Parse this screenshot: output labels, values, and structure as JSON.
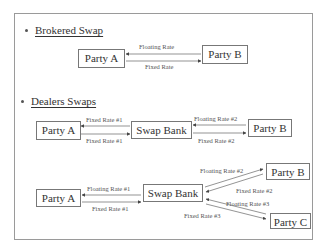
{
  "sections": {
    "brokered": {
      "title": "Brokered Swap",
      "parties": [
        "Party A",
        "Party B"
      ],
      "flows": [
        {
          "label": "Floating Rate",
          "from": "Party B",
          "to": "Party A"
        },
        {
          "label": "Fixed Rate",
          "from": "Party A",
          "to": "Party B"
        }
      ]
    },
    "dealers": {
      "title": "Dealers Swaps",
      "diagram1": {
        "nodes": [
          "Party A",
          "Swap Bank",
          "Party B"
        ],
        "flows": [
          {
            "label": "Fixed Rate #1",
            "from": "Swap Bank",
            "to": "Party A"
          },
          {
            "label": "Fixed Rate #1",
            "from": "Party A",
            "to": "Swap Bank"
          },
          {
            "label": "Floating Rate #2",
            "from": "Party B",
            "to": "Swap Bank"
          },
          {
            "label": "Fixed Rate #2",
            "from": "Swap Bank",
            "to": "Party B"
          }
        ]
      },
      "diagram2": {
        "nodes": [
          "Party A",
          "Swap Bank",
          "Party B",
          "Party C"
        ],
        "flows": [
          {
            "label": "Floating Rate #1",
            "from": "Swap Bank",
            "to": "Party A"
          },
          {
            "label": "Fixed Rate #1",
            "from": "Party A",
            "to": "Swap Bank"
          },
          {
            "label": "Floating Rate #2",
            "from": "Swap Bank",
            "to": "Party B"
          },
          {
            "label": "Fixed Rate #2",
            "from": "Party B",
            "to": "Swap Bank"
          },
          {
            "label": "Floating Rate #3",
            "from": "Party C",
            "to": "Swap Bank"
          },
          {
            "label": "Fixed Rate #3",
            "from": "Swap Bank",
            "to": "Party C"
          }
        ]
      }
    }
  },
  "colors": {
    "border": "#9a9a9a",
    "text": "#333333",
    "arrow": "#555555"
  }
}
